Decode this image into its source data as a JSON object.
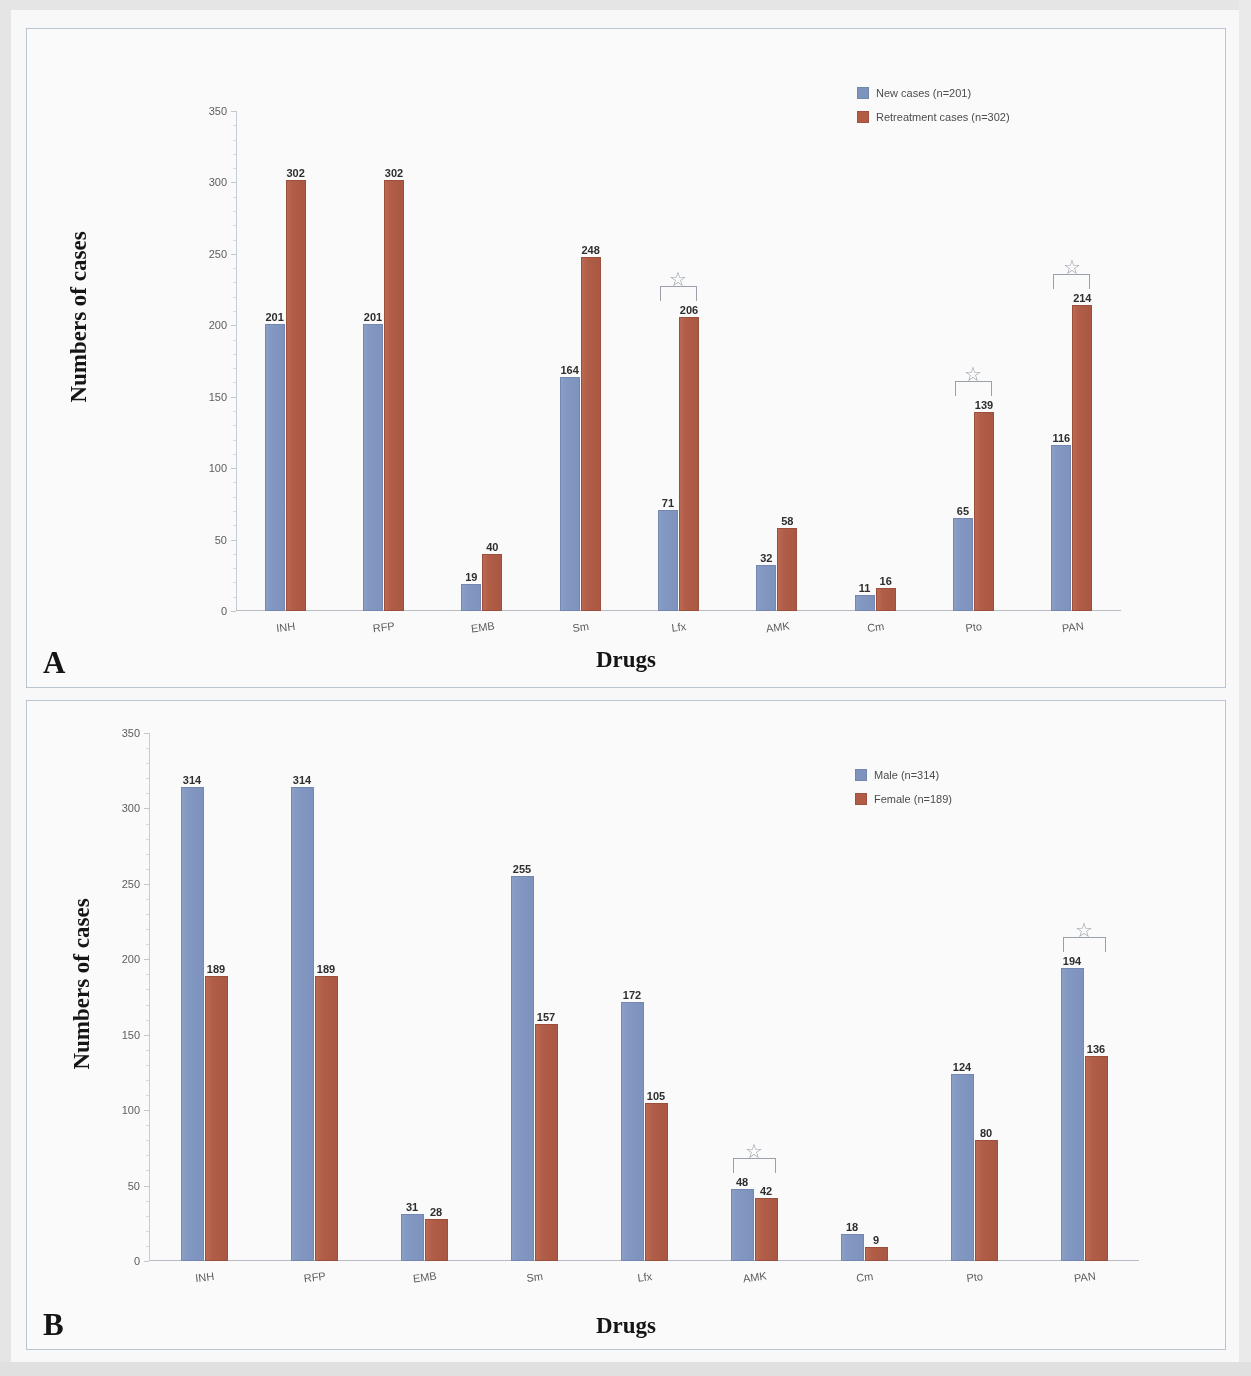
{
  "figure": {
    "panels": [
      {
        "letter": "A"
      },
      {
        "letter": "B"
      }
    ]
  },
  "chart_data": [
    {
      "type": "bar",
      "panel": "A",
      "title": "",
      "xlabel": "Drugs",
      "ylabel": "Numbers of cases",
      "ylim": [
        0,
        350
      ],
      "yticks": [
        0,
        50,
        100,
        150,
        200,
        250,
        300,
        350
      ],
      "grid": false,
      "legend_position": "top-right",
      "categories": [
        "INH",
        "RFP",
        "EMB",
        "Sm",
        "Lfx",
        "AMK",
        "Cm",
        "Pto",
        "PAN"
      ],
      "series": [
        {
          "name": "New cases (n=201)",
          "color": "#7b93c4",
          "values": [
            201,
            201,
            19,
            164,
            71,
            32,
            11,
            65,
            116
          ]
        },
        {
          "name": "Retreatment cases (n=302)",
          "color": "#b9573e",
          "values": [
            302,
            302,
            40,
            248,
            206,
            58,
            16,
            139,
            214
          ]
        }
      ],
      "annotations": [
        {
          "category": "Lfx",
          "marker": "star"
        },
        {
          "category": "Pto",
          "marker": "star"
        },
        {
          "category": "PAN",
          "marker": "star"
        }
      ]
    },
    {
      "type": "bar",
      "panel": "B",
      "title": "",
      "xlabel": "Drugs",
      "ylabel": "Numbers of cases",
      "ylim": [
        0,
        350
      ],
      "yticks": [
        0,
        50,
        100,
        150,
        200,
        250,
        300,
        350
      ],
      "grid": false,
      "legend_position": "top-right",
      "categories": [
        "INH",
        "RFP",
        "EMB",
        "Sm",
        "Lfx",
        "AMK",
        "Cm",
        "Pto",
        "PAN"
      ],
      "series": [
        {
          "name": "Male (n=314)",
          "color": "#7b93c4",
          "values": [
            314,
            314,
            31,
            255,
            172,
            48,
            18,
            124,
            194
          ]
        },
        {
          "name": "Female (n=189)",
          "color": "#b9573e",
          "values": [
            189,
            189,
            28,
            157,
            105,
            42,
            9,
            80,
            136
          ]
        }
      ],
      "annotations": [
        {
          "category": "AMK",
          "marker": "star"
        },
        {
          "category": "PAN",
          "marker": "star"
        }
      ]
    }
  ]
}
